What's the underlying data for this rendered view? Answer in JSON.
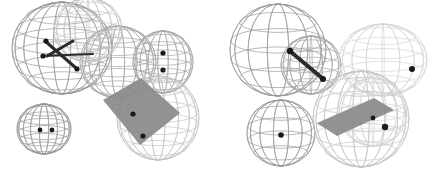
{
  "figure": {
    "background_color": "#ffffff",
    "width": 437,
    "height": 175,
    "panel_count": 2
  },
  "palette": {
    "background": "#ffffff",
    "wire_dark": "#9a9a9a",
    "wire_mid": "#a8a8a8",
    "wire_light": "#c4c4c4",
    "wire_faint": "#d6d6d6",
    "plane_fill": "#8a8a8a",
    "plane_fill_light": "#969696",
    "bond_dark": "#2b2b2b",
    "atom_dot": "#1a1a1a"
  },
  "panels": [
    {
      "id": "panel-left",
      "label": "left-panel",
      "spheres": [
        {
          "name": "sphere-upper-left-large",
          "cx": 62,
          "cy": 48,
          "rx": 50,
          "ry": 46,
          "shade": "wire_dark",
          "lat": 7,
          "lon": 9
        },
        {
          "name": "sphere-upper-right-mid",
          "cx": 118,
          "cy": 62,
          "rx": 38,
          "ry": 36,
          "shade": "wire_mid",
          "lat": 7,
          "lon": 9
        },
        {
          "name": "sphere-upper-center-back",
          "cx": 88,
          "cy": 30,
          "rx": 34,
          "ry": 32,
          "shade": "wire_light",
          "lat": 6,
          "lon": 8
        },
        {
          "name": "sphere-lower-left-small",
          "cx": 44,
          "cy": 129,
          "rx": 27,
          "ry": 25,
          "shade": "wire_dark",
          "lat": 7,
          "lon": 9
        },
        {
          "name": "sphere-right-upper-small",
          "cx": 163,
          "cy": 62,
          "rx": 30,
          "ry": 31,
          "shade": "wire_mid",
          "lat": 7,
          "lon": 9
        },
        {
          "name": "sphere-right-lower-large",
          "cx": 158,
          "cy": 118,
          "rx": 41,
          "ry": 42,
          "shade": "wire_light",
          "lat": 7,
          "lon": 9
        }
      ],
      "planes": [
        {
          "name": "gray-plane-quad",
          "fill": "plane_fill",
          "points": "103,100 141,78 180,113 140,145"
        }
      ],
      "bonds": [
        {
          "name": "bond-upper-left-branch",
          "x1": 47,
          "y1": 56,
          "x2": 73,
          "y2": 41,
          "width": 3
        },
        {
          "name": "bond-cross-descending",
          "x1": 45,
          "y1": 41,
          "x2": 76,
          "y2": 68,
          "width": 3
        },
        {
          "name": "bond-horizontal-right",
          "x1": 42,
          "y1": 56,
          "x2": 93,
          "y2": 54,
          "width": 2
        }
      ],
      "atoms": [
        {
          "name": "atom-dot-bond-left",
          "cx": 43,
          "cy": 56,
          "r": 2.6
        },
        {
          "name": "atom-dot-bond-top",
          "cx": 46,
          "cy": 41,
          "r": 2.6
        },
        {
          "name": "atom-dot-bond-end",
          "cx": 77,
          "cy": 69,
          "r": 2.6
        },
        {
          "name": "atom-dot-sphere-small-a",
          "cx": 40,
          "cy": 130,
          "r": 2.4
        },
        {
          "name": "atom-dot-sphere-small-b",
          "cx": 52,
          "cy": 130,
          "r": 2.4
        },
        {
          "name": "atom-dot-right-upper-a",
          "cx": 163,
          "cy": 53,
          "r": 2.6
        },
        {
          "name": "atom-dot-right-upper-b",
          "cx": 163,
          "cy": 70,
          "r": 2.6
        },
        {
          "name": "atom-dot-plane-center",
          "cx": 133,
          "cy": 114,
          "r": 2.6
        },
        {
          "name": "atom-dot-plane-lower",
          "cx": 143,
          "cy": 136,
          "r": 2.6
        }
      ]
    },
    {
      "id": "panel-right",
      "label": "right-panel",
      "spheres": [
        {
          "name": "sphere-upper-left-polyhedron",
          "cx": 60,
          "cy": 50,
          "rx": 48,
          "ry": 46,
          "shade": "wire_dark",
          "lat": 5,
          "lon": 7
        },
        {
          "name": "sphere-upper-inner",
          "cx": 93,
          "cy": 65,
          "rx": 30,
          "ry": 29,
          "shade": "wire_mid",
          "lat": 6,
          "lon": 8
        },
        {
          "name": "sphere-lower-left-polyhedron",
          "cx": 63,
          "cy": 133,
          "rx": 34,
          "ry": 33,
          "shade": "wire_dark",
          "lat": 5,
          "lon": 7
        },
        {
          "name": "sphere-right-upper-light",
          "cx": 165,
          "cy": 60,
          "rx": 44,
          "ry": 36,
          "shade": "wire_faint",
          "lat": 6,
          "lon": 8
        },
        {
          "name": "sphere-right-lower-large",
          "cx": 143,
          "cy": 119,
          "rx": 48,
          "ry": 48,
          "shade": "wire_light",
          "lat": 6,
          "lon": 9
        },
        {
          "name": "sphere-right-lower-inner",
          "cx": 155,
          "cy": 112,
          "rx": 34,
          "ry": 34,
          "shade": "wire_faint",
          "lat": 6,
          "lon": 8
        }
      ],
      "planes": [
        {
          "name": "gray-plane-slab",
          "fill": "plane_fill",
          "points": "99,123 156,98 176,110 119,136"
        }
      ],
      "bonds": [
        {
          "name": "bond-main-diagonal",
          "x1": 73,
          "y1": 52,
          "x2": 104,
          "y2": 78,
          "width": 4
        }
      ],
      "atoms": [
        {
          "name": "atom-dot-bond-start",
          "cx": 72,
          "cy": 51,
          "r": 3.2
        },
        {
          "name": "atom-dot-bond-end",
          "cx": 105,
          "cy": 79,
          "r": 3.0
        },
        {
          "name": "atom-dot-lower-sphere",
          "cx": 63,
          "cy": 135,
          "r": 2.8
        },
        {
          "name": "atom-dot-right-sphere",
          "cx": 194,
          "cy": 69,
          "r": 3.0
        },
        {
          "name": "atom-dot-plane-center",
          "cx": 155,
          "cy": 118,
          "r": 2.4
        },
        {
          "name": "atom-dot-plane-edge",
          "cx": 167,
          "cy": 127,
          "r": 3.2
        }
      ]
    }
  ]
}
